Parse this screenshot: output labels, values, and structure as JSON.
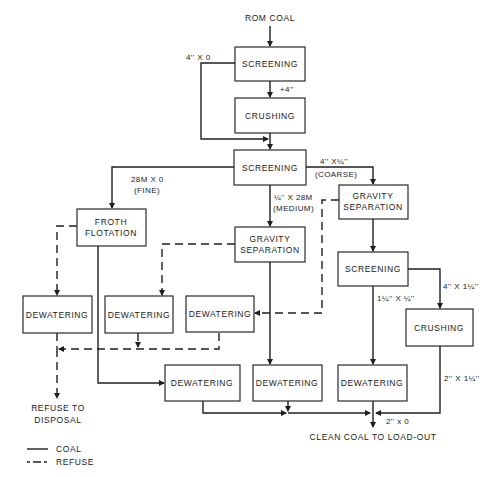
{
  "diagram": {
    "source_label": "ROM COAL",
    "output_label": "CLEAN COAL TO LOAD-OUT",
    "refuse_label_line1": "REFUSE TO",
    "refuse_label_line2": "DISPOSAL",
    "nodes": {
      "screening_1": "SCREENING",
      "crushing_1": "CRUSHING",
      "screening_2": "SCREENING",
      "froth_flotation_line1": "FROTH",
      "froth_flotation_line2": "FLOTATION",
      "gravity_sep_medium_line1": "GRAVITY",
      "gravity_sep_medium_line2": "SEPARATION",
      "gravity_sep_coarse_line1": "GRAVITY",
      "gravity_sep_coarse_line2": "SEPARATION",
      "screening_3": "SCREENING",
      "crushing_2": "CRUSHING",
      "dewatering_refuse_fine": "DEWATERING",
      "dewatering_refuse_medium": "DEWATERING",
      "dewatering_refuse_coarse": "DEWATERING",
      "dewatering_clean_fine": "DEWATERING",
      "dewatering_clean_medium": "DEWATERING",
      "dewatering_clean_coarse": "DEWATERING"
    },
    "edge_labels": {
      "undersize_bypass": "4'' X 0",
      "oversize": "+4''",
      "coarse_size": "4'' X¼''",
      "coarse": "(COARSE)",
      "fine_size": "28M X 0",
      "fine": "(FINE)",
      "medium_size": "¼'' X 28M",
      "medium": "(MEDIUM)",
      "screen3_under": "1¼'' X ¼''",
      "screen3_over": "4'' X 1¼''",
      "crusher2_out": "2'' X 1¼''",
      "final_size": "2'' x 0"
    },
    "legend": [
      {
        "style": "solid",
        "label": "COAL"
      },
      {
        "style": "dashed",
        "label": "REFUSE"
      }
    ]
  }
}
